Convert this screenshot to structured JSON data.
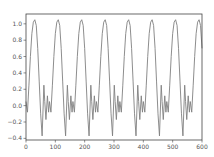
{
  "chart_data": {
    "type": "line",
    "title": "",
    "xlabel": "",
    "ylabel": "",
    "xlim": [
      0,
      600
    ],
    "ylim": [
      -0.4,
      1.1
    ],
    "grid": false,
    "legend": null,
    "x_ticks": [
      "0",
      "100",
      "200",
      "300",
      "400",
      "500",
      "600"
    ],
    "y_ticks": [
      "-0.4",
      "-0.2",
      "0.0",
      "0.2",
      "0.4",
      "0.6",
      "0.8",
      "1.0"
    ],
    "line_color": "#808080",
    "period": 80,
    "series": [
      {
        "name": "signal",
        "x": [
          0,
          5,
          10,
          15,
          20,
          25,
          30,
          35,
          40,
          45,
          50,
          55,
          61,
          64,
          68,
          73,
          77,
          80,
          85,
          90,
          95,
          100,
          105,
          110,
          115,
          120,
          125,
          130,
          135,
          141,
          144,
          148,
          153,
          157,
          160,
          165,
          170,
          175,
          180,
          185,
          190,
          195,
          200,
          205,
          210,
          215,
          221,
          224,
          228,
          233,
          237,
          240,
          245,
          250,
          255,
          260,
          265,
          270,
          275,
          280,
          285,
          290,
          295,
          301,
          304,
          308,
          313,
          317,
          320,
          325,
          330,
          335,
          340,
          345,
          350,
          355,
          360,
          365,
          370,
          375,
          381,
          384,
          388,
          393,
          397,
          400,
          405,
          410,
          415,
          420,
          425,
          430,
          435,
          440,
          445,
          450,
          455,
          461,
          464,
          468,
          473,
          477,
          480,
          485,
          490,
          495,
          500,
          505,
          510,
          515,
          520,
          525,
          530,
          535,
          541,
          544,
          548,
          553,
          557,
          560,
          565,
          570,
          575,
          580,
          585,
          590,
          595,
          600
        ],
        "y": [
          0.05,
          -0.08,
          0.25,
          0.6,
          0.88,
          1.02,
          1.05,
          0.98,
          0.7,
          0.3,
          -0.1,
          -0.37,
          0.25,
          0.05,
          -0.17,
          0.12,
          -0.08,
          0.05,
          -0.08,
          0.25,
          0.6,
          0.88,
          1.02,
          1.05,
          0.98,
          0.7,
          0.3,
          -0.1,
          -0.37,
          0.25,
          0.05,
          -0.17,
          0.12,
          -0.08,
          0.05,
          -0.08,
          0.25,
          0.6,
          0.88,
          1.02,
          1.05,
          0.98,
          0.7,
          0.3,
          -0.1,
          -0.37,
          0.25,
          0.05,
          -0.17,
          0.12,
          -0.08,
          0.05,
          -0.08,
          0.25,
          0.6,
          0.88,
          1.02,
          1.05,
          0.98,
          0.7,
          0.3,
          -0.1,
          -0.37,
          0.25,
          0.05,
          -0.17,
          0.12,
          -0.08,
          0.05,
          -0.08,
          0.25,
          0.6,
          0.88,
          1.02,
          1.05,
          0.98,
          0.7,
          0.3,
          -0.1,
          -0.37,
          0.25,
          0.05,
          -0.17,
          0.12,
          -0.08,
          0.05,
          -0.08,
          0.25,
          0.6,
          0.88,
          1.02,
          1.05,
          0.98,
          0.7,
          0.3,
          -0.1,
          -0.37,
          0.25,
          0.05,
          -0.17,
          0.12,
          -0.08,
          0.05,
          -0.08,
          0.25,
          0.6,
          0.88,
          1.02,
          1.05,
          0.98,
          0.7,
          0.3,
          -0.1,
          -0.37,
          0.25,
          0.05,
          -0.17,
          0.12,
          -0.08,
          0.05,
          -0.08,
          0.25,
          0.6,
          0.88,
          1.02,
          1.05,
          0.98,
          0.7
        ]
      }
    ]
  }
}
